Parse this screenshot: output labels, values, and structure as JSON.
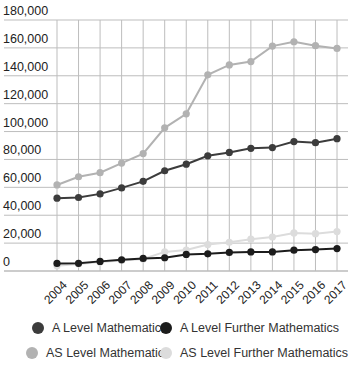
{
  "chart_data": {
    "type": "line",
    "title": "",
    "xlabel": "",
    "ylabel": "",
    "ylim": [
      0,
      180000
    ],
    "y_ticks": [
      0,
      20000,
      40000,
      60000,
      80000,
      100000,
      120000,
      140000,
      160000,
      180000
    ],
    "y_tick_labels": [
      "0",
      "20,000",
      "40,000",
      "60,000",
      "80,000",
      "100,000",
      "120,000",
      "140,000",
      "160,000",
      "180,000"
    ],
    "grid": true,
    "legend_position": "bottom",
    "categories": [
      "2004",
      "2005",
      "2006",
      "2007",
      "2008",
      "2009",
      "2010",
      "2011",
      "2012",
      "2013",
      "2014",
      "2015",
      "2016",
      "2017"
    ],
    "series": [
      {
        "name": "A Level Mathematics",
        "color": "#3c3c3c",
        "values": [
          52200,
          52700,
          55300,
          59600,
          64300,
          71900,
          76600,
          82600,
          85000,
          88000,
          88500,
          92800,
          92000,
          94900
        ]
      },
      {
        "name": "A Level Further Mathematics",
        "color": "#1c1c1c",
        "values": [
          5400,
          5500,
          6900,
          8000,
          9000,
          9500,
          11900,
          12300,
          13300,
          13700,
          13700,
          14900,
          15400,
          16100
        ]
      },
      {
        "name": "AS Level Mathematics",
        "color": "#b2b2b2",
        "values": [
          61700,
          67600,
          70500,
          77400,
          84200,
          102700,
          112700,
          140700,
          147800,
          150200,
          161300,
          164400,
          161600,
          159600
        ]
      },
      {
        "name": "AS Level Further Mathematics",
        "color": "#dcdcdc",
        "values": [
          3800,
          5000,
          6500,
          7600,
          8600,
          13700,
          15000,
          19000,
          20600,
          22800,
          24400,
          27300,
          26800,
          28300
        ]
      }
    ]
  },
  "legend": {
    "items": [
      {
        "label": "A Level Mathematics",
        "color": "#3c3c3c"
      },
      {
        "label": "A Level Further Mathematics",
        "color": "#1c1c1c"
      },
      {
        "label": "AS Level Mathematics",
        "color": "#b2b2b2"
      },
      {
        "label": "AS Level Further Mathematics",
        "color": "#dcdcdc"
      }
    ]
  }
}
